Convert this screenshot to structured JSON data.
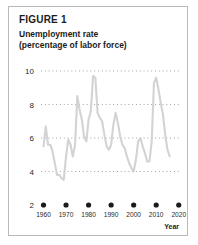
{
  "figure": {
    "label": "FIGURE 1",
    "title_line1": "Unemployment rate",
    "title_line2": "(percentage of labor force)"
  },
  "colors": {
    "line": "#d3d3d3",
    "grid": "#9a9a9a",
    "text": "#1b1b1b",
    "border": "#b9b9b9",
    "background": "#ffffff"
  },
  "axes": {
    "y_ticks": [
      "10",
      "8",
      "6",
      "4",
      "2"
    ],
    "x_ticks": [
      "1960",
      "1970",
      "1980",
      "1990",
      "2000",
      "2010",
      "2020"
    ],
    "x_axis_name": "Year"
  },
  "chart_data": {
    "type": "line",
    "title": "Unemployment rate (percentage of labor force)",
    "xlabel": "Year",
    "ylabel": "",
    "xlim": [
      1958,
      2021
    ],
    "ylim": [
      2,
      10
    ],
    "grid": true,
    "gridlines_y": [
      4,
      6,
      8,
      10
    ],
    "legend": "none",
    "series": [
      {
        "name": "Unemployment rate",
        "color": "#d3d3d3",
        "x": [
          1960,
          1961,
          1962,
          1963,
          1964,
          1965,
          1966,
          1967,
          1968,
          1969,
          1970,
          1971,
          1972,
          1973,
          1974,
          1975,
          1976,
          1977,
          1978,
          1979,
          1980,
          1981,
          1982,
          1983,
          1984,
          1985,
          1986,
          1987,
          1988,
          1989,
          1990,
          1991,
          1992,
          1993,
          1994,
          1995,
          1996,
          1997,
          1998,
          1999,
          2000,
          2001,
          2002,
          2003,
          2004,
          2005,
          2006,
          2007,
          2008,
          2009,
          2010,
          2011,
          2012,
          2013,
          2014,
          2015,
          2016
        ],
        "values": [
          5.5,
          6.7,
          5.6,
          5.6,
          5.2,
          4.5,
          3.8,
          3.8,
          3.6,
          3.5,
          4.9,
          5.9,
          5.6,
          4.9,
          5.6,
          8.5,
          7.7,
          7.1,
          6.1,
          5.8,
          7.1,
          7.6,
          9.7,
          9.6,
          7.5,
          7.2,
          7.0,
          6.2,
          5.5,
          5.3,
          5.6,
          6.8,
          7.5,
          6.9,
          6.1,
          5.6,
          5.4,
          4.9,
          4.5,
          4.2,
          4.0,
          4.7,
          5.8,
          6.0,
          5.5,
          5.1,
          4.6,
          4.6,
          5.8,
          9.3,
          9.6,
          8.9,
          8.1,
          7.4,
          6.2,
          5.3,
          4.9
        ]
      }
    ]
  }
}
